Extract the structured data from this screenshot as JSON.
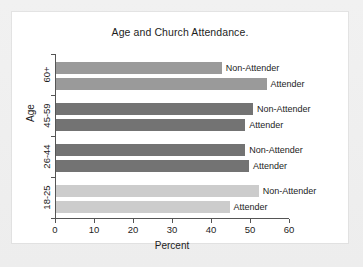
{
  "chart_data": {
    "type": "bar",
    "orientation": "horizontal",
    "title": "Age and Church Attendance.",
    "xlabel": "Percent",
    "ylabel": "Age",
    "xlim": [
      0,
      60
    ],
    "xticks": [
      0,
      10,
      20,
      30,
      40,
      50,
      60
    ],
    "xticklabels": [
      "0",
      "10",
      "20",
      "30",
      "40",
      "50",
      "60"
    ],
    "grid": false,
    "legend": "none",
    "categories": [
      "18-25",
      "26-44",
      "45-59",
      "60+"
    ],
    "series": [
      {
        "name": "Non-Attender",
        "values": [
          52.0,
          48.5,
          50.5,
          42.5
        ]
      },
      {
        "name": "Attender",
        "values": [
          44.5,
          49.5,
          48.5,
          54.0
        ]
      }
    ],
    "groups": [
      {
        "category": "60+",
        "color": "#9a9a9a",
        "bars": [
          {
            "label": "Non-Attender",
            "value": 42.5
          },
          {
            "label": "Attender",
            "value": 54.0
          }
        ]
      },
      {
        "category": "45-59",
        "color": "#737373",
        "bars": [
          {
            "label": "Non-Attender",
            "value": 50.5
          },
          {
            "label": "Attender",
            "value": 48.5
          }
        ]
      },
      {
        "category": "26-44",
        "color": "#737373",
        "bars": [
          {
            "label": "Non-Attender",
            "value": 48.5
          },
          {
            "label": "Attender",
            "value": 49.5
          }
        ]
      },
      {
        "category": "18-25",
        "color": "#cccccc",
        "bars": [
          {
            "label": "Non-Attender",
            "value": 52.0
          },
          {
            "label": "Attender",
            "value": 44.5
          }
        ]
      }
    ]
  },
  "style": {
    "page_background": "#eeeeee",
    "panel_background": "#ffffff",
    "axis_color": "#555555",
    "text_color": "#1d1d1d"
  }
}
